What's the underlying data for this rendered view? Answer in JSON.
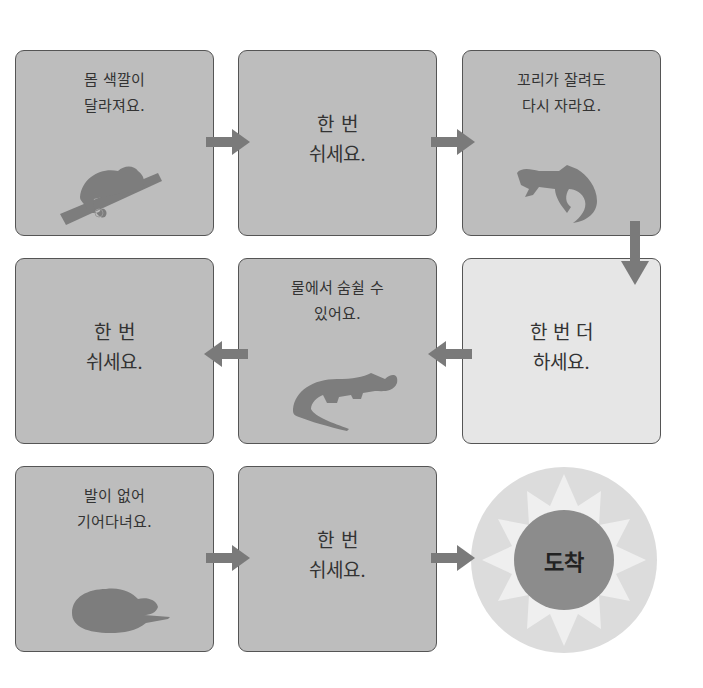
{
  "board": {
    "spaces": [
      {
        "id": 1,
        "line1": "몸 색깔이",
        "line2": "달라져요.",
        "animal": "chameleon-icon",
        "style": "dark"
      },
      {
        "id": 2,
        "line1": "한 번",
        "line2": "쉬세요.",
        "style": "dark"
      },
      {
        "id": 3,
        "line1": "꼬리가 잘려도",
        "line2": "다시 자라요.",
        "animal": "lizard-icon",
        "style": "dark"
      },
      {
        "id": 4,
        "line1": "한 번",
        "line2": "쉬세요.",
        "style": "dark"
      },
      {
        "id": 5,
        "line1": "물에서 숨쉴 수",
        "line2": "있어요.",
        "animal": "crocodile-icon",
        "style": "dark"
      },
      {
        "id": 6,
        "line1": "한 번 더",
        "line2": "하세요.",
        "style": "light"
      },
      {
        "id": 7,
        "line1": "발이 없어",
        "line2": "기어다녀요.",
        "animal": "snake-icon",
        "style": "dark"
      },
      {
        "id": 8,
        "line1": "한 번",
        "line2": "쉬세요.",
        "style": "dark"
      }
    ],
    "finish": {
      "label": "도착"
    }
  },
  "colors": {
    "box_dark": "#bdbdbd",
    "box_light": "#e6e6e6",
    "border": "#555555",
    "arrow": "#7a7a7a",
    "silhouette": "#7d7d7d",
    "finish_outer": "#dcdcdc",
    "finish_star": "#efefef",
    "finish_inner": "#8c8c8c"
  }
}
